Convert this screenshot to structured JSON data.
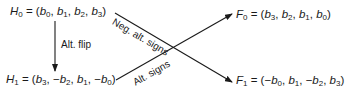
{
  "diagram": {
    "nodes": {
      "H0": {
        "name": "H",
        "sub": "0",
        "eq": " = (",
        "terms": [
          {
            "sign": "",
            "var": "b",
            "sub": "0"
          },
          {
            "sign": "",
            "var": "b",
            "sub": "1"
          },
          {
            "sign": "",
            "var": "b",
            "sub": "2"
          },
          {
            "sign": "",
            "var": "b",
            "sub": "3"
          }
        ]
      },
      "H1": {
        "name": "H",
        "sub": "1",
        "eq": " = (",
        "terms": [
          {
            "sign": "",
            "var": "b",
            "sub": "3"
          },
          {
            "sign": "−",
            "var": "b",
            "sub": "2"
          },
          {
            "sign": "",
            "var": "b",
            "sub": "1"
          },
          {
            "sign": "−",
            "var": "b",
            "sub": "0"
          }
        ]
      },
      "F0": {
        "name": "F",
        "sub": "0",
        "eq": " = (",
        "terms": [
          {
            "sign": "",
            "var": "b",
            "sub": "3"
          },
          {
            "sign": "",
            "var": "b",
            "sub": "2"
          },
          {
            "sign": "",
            "var": "b",
            "sub": "1"
          },
          {
            "sign": "",
            "var": "b",
            "sub": "0"
          }
        ]
      },
      "F1": {
        "name": "F",
        "sub": "1",
        "eq": " = (",
        "terms": [
          {
            "sign": "−",
            "var": "b",
            "sub": "0"
          },
          {
            "sign": "",
            "var": "b",
            "sub": "1"
          },
          {
            "sign": "−",
            "var": "b",
            "sub": "2"
          },
          {
            "sign": "",
            "var": "b",
            "sub": "3"
          }
        ]
      }
    },
    "edges": [
      {
        "from": "H0",
        "to": "H1",
        "label": "Alt. flip"
      },
      {
        "from": "H0",
        "to": "F1",
        "label": "Neg. alt. signs"
      },
      {
        "from": "H1",
        "to": "F0",
        "label": "Alt. signs"
      }
    ],
    "line_color": "#1a1a1a"
  }
}
